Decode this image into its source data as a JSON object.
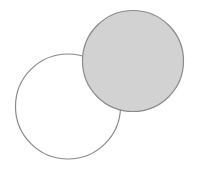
{
  "figure": {
    "width": 198,
    "height": 173,
    "background_color": "#ffffff",
    "stroke_color": "#8a8a8a",
    "fill_color": "#d2d2d2",
    "stroke_width": 1.2,
    "shapes": [
      {
        "id": "unfilled-circle",
        "name": "unfilled-circle",
        "type": "circle",
        "cx": 68,
        "cy": 106.5,
        "r": 52.5,
        "fill": "none",
        "stroke": "#8a8a8a",
        "stroke_width": 1.2,
        "label": "Unfilled circle (lower left)"
      },
      {
        "id": "filled-circle",
        "name": "filled-circle",
        "type": "circle",
        "cx": 133,
        "cy": 61,
        "r": 50.5,
        "fill": "#d2d2d2",
        "stroke": "#8a8a8a",
        "stroke_width": 1.2,
        "label": "Shaded circle (upper right)"
      }
    ],
    "intersection_points": [
      {
        "name": "upper-intersection",
        "x": 82,
        "y": 55
      },
      {
        "name": "lower-intersection",
        "x": 114,
        "y": 108
      }
    ]
  }
}
